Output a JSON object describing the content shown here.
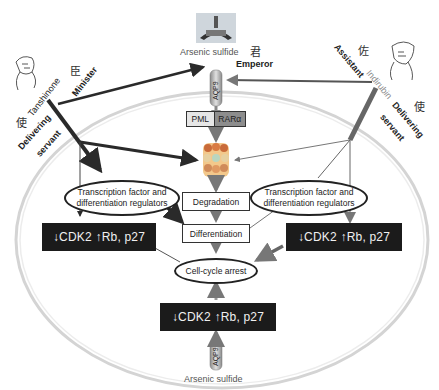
{
  "top": {
    "drug": "Arsenic sulfide",
    "emperor_cjk": "君",
    "emperor_label": "Emperor",
    "channel_label": "AQP9"
  },
  "left_figure": {
    "drug": "Tanshinone",
    "minister_cjk": "臣",
    "minister_label": "Minister",
    "servant_cjk": "使",
    "servant_label_1": "Delivering",
    "servant_label_2": "servant"
  },
  "right_figure": {
    "assistant_cjk": "佐",
    "assistant_label": "Assistant",
    "drug": "Indirubin",
    "servant_cjk": "使",
    "servant_label_1": "Delivering",
    "servant_label_2": "servant"
  },
  "center": {
    "pml": "PML",
    "rara": "RARα",
    "degradation": "Degradation",
    "differentiation": "Differentiation",
    "cell_cycle_arrest": "Cell-cycle arrest"
  },
  "left_oval": {
    "line1": "Transcription factor and",
    "line2": "differentiation regulators"
  },
  "right_oval": {
    "line1": "Transcription factor and",
    "line2": "differentiation regulators"
  },
  "cdk_boxes": {
    "left": "↓CDK2 ↑Rb, p27",
    "right": "↓CDK2 ↑Rb, p27",
    "bottom": "↓CDK2 ↑Rb, p27"
  },
  "bottom": {
    "drug": "Arsenic sulfide",
    "channel_label": "AQP9"
  },
  "colors": {
    "dark_box": "#1b1b1b",
    "arrow_dark": "#2a2a2a",
    "arrow_gray": "#6b6b6b",
    "cell_membrane": "#d8d8d8"
  }
}
